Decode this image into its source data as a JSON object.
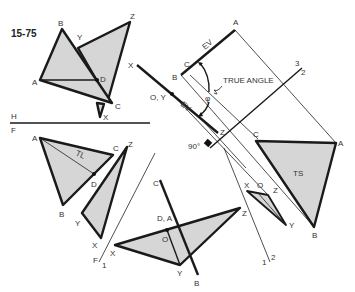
{
  "figure": {
    "number": "15-75",
    "fold_lines": {
      "hf": {
        "top": "H",
        "bottom": "F"
      },
      "f1": {
        "a": "F",
        "b": "1"
      },
      "v12": {
        "a": "1",
        "b": "2"
      },
      "v23": {
        "a": "3",
        "b": "2"
      }
    },
    "annotations": {
      "true_angle": "TRUE ANGLE",
      "ev_top": "EV",
      "ev_mid": "EV",
      "tl": "TL",
      "ts": "TS",
      "right_angle": "90°",
      "phi": "φ"
    },
    "top_view": {
      "abc": {
        "A": "A",
        "B": "B",
        "C": "C",
        "D": "D"
      },
      "xyz": {
        "X": "X",
        "Y": "Y",
        "Z": "Z"
      }
    },
    "front_view": {
      "abc": {
        "A": "A",
        "B": "B",
        "C": "C",
        "D": "D"
      },
      "xyz": {
        "X": "X",
        "Y": "Y",
        "Z": "Z"
      }
    },
    "aux1_view": {
      "line_cb": {
        "C": "C",
        "B": "B"
      },
      "da": "D, A",
      "o": "O",
      "xyz": {
        "X": "X",
        "Y": "Y",
        "Z": "Z"
      }
    },
    "aux2_view": {
      "x": "X",
      "oy": "O, Y",
      "z": "Z",
      "b": "B",
      "c": "C",
      "a": "A"
    },
    "aux3_view": {
      "ts_tri": {
        "A": "A",
        "B": "B",
        "C": "C"
      },
      "small_tri": {
        "X": "X",
        "O": "O",
        "Z": "Z",
        "Y": "Y"
      }
    }
  }
}
